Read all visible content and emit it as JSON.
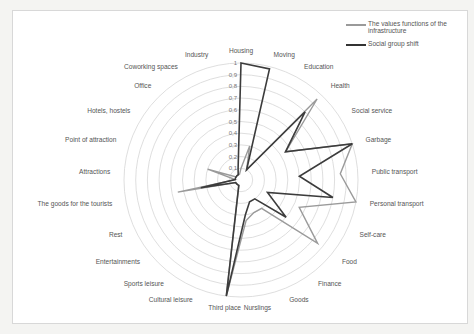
{
  "chart_data": {
    "type": "radar",
    "title": "",
    "categories": [
      "Housing",
      "Moving",
      "Education",
      "Health",
      "Social service",
      "Garbage",
      "Public transport",
      "Personal transport",
      "Self-care",
      "Food",
      "Finance",
      "Goods",
      "Nurslings",
      "Third place",
      "Cultural leisure",
      "Sports leisure",
      "Entertainments",
      "Rest",
      "The goods for the tourists",
      "Attractions",
      "Point of attraction",
      "Hotels, hostels",
      "Office",
      "Coworking spaces",
      "Industry"
    ],
    "ticks": [
      "0,1",
      "0,2",
      "0,3",
      "0,4",
      "0,5",
      "0,6",
      "0,7",
      "0,8",
      "0,9",
      "1"
    ],
    "range": [
      0,
      1
    ],
    "series": [
      {
        "name": "The values functions of the infrastructure",
        "color": "#9a9a9a",
        "values": [
          0.1,
          0.3,
          0.1,
          0.95,
          0.45,
          1.0,
          0.85,
          1.0,
          0.55,
          0.85,
          0.3,
          0.3,
          0.35,
          1.0,
          0.05,
          0.05,
          0.05,
          0.05,
          0.55,
          0.05,
          0.3,
          0.05,
          0.05,
          0.05,
          0.05
        ]
      },
      {
        "name": "Social group shift",
        "color": "#3c3c3c",
        "values": [
          1.0,
          0.98,
          0.1,
          0.8,
          0.45,
          1.0,
          0.5,
          0.8,
          0.25,
          0.5,
          0.2,
          0.2,
          0.3,
          1.0,
          0.05,
          0.05,
          0.05,
          0.05,
          0.35,
          0.05,
          0.05,
          0.05,
          0.05,
          0.05,
          0.1
        ]
      }
    ],
    "legend_position": "top-right",
    "grid": true
  },
  "legend": {
    "items": [
      {
        "label": "The values functions of the infrastructure"
      },
      {
        "label": "Social group shift"
      }
    ]
  }
}
